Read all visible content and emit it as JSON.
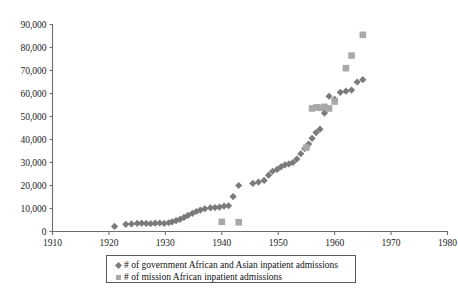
{
  "chart_data": {
    "type": "scatter",
    "title": "",
    "subtitle": "",
    "xlabel": "",
    "ylabel": "",
    "xlim": [
      1910,
      1980
    ],
    "ylim": [
      0,
      90000
    ],
    "xticks": [
      "1910",
      "1920",
      "1930",
      "1940",
      "1950",
      "1960",
      "1970",
      "1980"
    ],
    "xtick_values": [
      1910,
      1920,
      1930,
      1940,
      1950,
      1960,
      1970,
      1980
    ],
    "yticks": [
      "0",
      "10,000",
      "20,000",
      "30,000",
      "40,000",
      "50,000",
      "60,000",
      "70,000",
      "80,000",
      "90,000"
    ],
    "ytick_values": [
      0,
      10000,
      20000,
      30000,
      40000,
      50000,
      60000,
      70000,
      80000,
      90000
    ],
    "grid": false,
    "legend_position": "bottom-center",
    "series": [
      {
        "name": "# of government African and Asian inpatient admissions",
        "marker": "diamond",
        "color": "#7b7b7b",
        "points": [
          [
            1921,
            2200
          ],
          [
            1923,
            3100
          ],
          [
            1924,
            3300
          ],
          [
            1925,
            3500
          ],
          [
            1925.8,
            3600
          ],
          [
            1926.6,
            3500
          ],
          [
            1927.4,
            3400
          ],
          [
            1928.2,
            3600
          ],
          [
            1929,
            3700
          ],
          [
            1929.8,
            3500
          ],
          [
            1930.6,
            3800
          ],
          [
            1931.2,
            4200
          ],
          [
            1931.9,
            4700
          ],
          [
            1932.6,
            5300
          ],
          [
            1933.3,
            6100
          ],
          [
            1934,
            7000
          ],
          [
            1934.8,
            7900
          ],
          [
            1935.5,
            8700
          ],
          [
            1936.2,
            9300
          ],
          [
            1937,
            9900
          ],
          [
            1938,
            10300
          ],
          [
            1938.8,
            10400
          ],
          [
            1939.6,
            10600
          ],
          [
            1940.4,
            11000
          ],
          [
            1941.2,
            11200
          ],
          [
            1942,
            15200
          ],
          [
            1943,
            20000
          ],
          [
            1945.5,
            20900
          ],
          [
            1946.5,
            21500
          ],
          [
            1947.5,
            22200
          ],
          [
            1948.3,
            24500
          ],
          [
            1949,
            26200
          ],
          [
            1949.8,
            27000
          ],
          [
            1950.5,
            28100
          ],
          [
            1951.2,
            29000
          ],
          [
            1951.9,
            29400
          ],
          [
            1952.6,
            30000
          ],
          [
            1953.3,
            31500
          ],
          [
            1954,
            33800
          ],
          [
            1954.7,
            36000
          ],
          [
            1955.4,
            38000
          ],
          [
            1956,
            40500
          ],
          [
            1956.7,
            43000
          ],
          [
            1957.4,
            44500
          ],
          [
            1958.2,
            51500
          ],
          [
            1959,
            58800
          ],
          [
            1960,
            57500
          ],
          [
            1961,
            60500
          ],
          [
            1962,
            61000
          ],
          [
            1963,
            61500
          ],
          [
            1964,
            65000
          ],
          [
            1965,
            66000
          ]
        ]
      },
      {
        "name": "# of mission African inpatient admissions",
        "marker": "square",
        "color": "#a9a9a9",
        "points": [
          [
            1940,
            4200
          ],
          [
            1943,
            4000
          ],
          [
            1955,
            36500
          ],
          [
            1956,
            53500
          ],
          [
            1956.8,
            54000
          ],
          [
            1957.5,
            53800
          ],
          [
            1958.2,
            54200
          ],
          [
            1959,
            53500
          ],
          [
            1960,
            56500
          ],
          [
            1962,
            71000
          ],
          [
            1963,
            76500
          ],
          [
            1965,
            85500
          ]
        ]
      }
    ]
  },
  "legend": {
    "entries": [
      {
        "label": "# of government African and Asian inpatient admissions",
        "marker": "diamond",
        "color": "#7b7b7b"
      },
      {
        "label": "# of mission African inpatient admissions",
        "marker": "square",
        "color": "#a9a9a9"
      }
    ]
  },
  "axes": {
    "axis_color": "#6d6d6d"
  }
}
